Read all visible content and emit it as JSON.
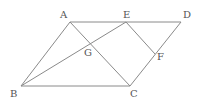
{
  "diagram": {
    "type": "geometry",
    "points": {
      "A": {
        "x": 70,
        "y": 22,
        "label": "A"
      },
      "B": {
        "x": 21,
        "y": 86,
        "label": "B"
      },
      "C": {
        "x": 130,
        "y": 86,
        "label": "C"
      },
      "D": {
        "x": 181,
        "y": 22,
        "label": "D"
      },
      "E": {
        "x": 126,
        "y": 22,
        "label": "E"
      },
      "F": {
        "x": 155,
        "y": 54,
        "label": "F"
      },
      "G": {
        "x": 91,
        "y": 44,
        "label": "G"
      }
    },
    "segments": [
      [
        "A",
        "D"
      ],
      [
        "B",
        "C"
      ],
      [
        "A",
        "B"
      ],
      [
        "C",
        "D"
      ],
      [
        "A",
        "C"
      ],
      [
        "B",
        "E"
      ],
      [
        "E",
        "F"
      ]
    ],
    "colors": {
      "line": "#8a8a8a",
      "label": "#555555",
      "background": "#ffffff"
    }
  }
}
